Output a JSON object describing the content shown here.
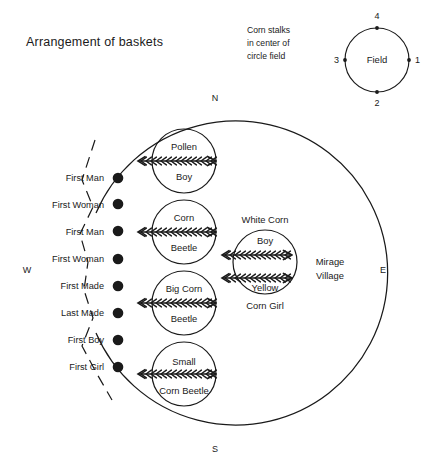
{
  "title": "Arrangement of baskets",
  "note": {
    "lines": [
      "Corn stalks",
      "in center of",
      "circle field"
    ]
  },
  "field_circle": {
    "label": "Field",
    "markers": [
      {
        "id": "1",
        "label": "1",
        "position": "east"
      },
      {
        "id": "2",
        "label": "2",
        "position": "south"
      },
      {
        "id": "3",
        "label": "3",
        "position": "west"
      },
      {
        "id": "4",
        "label": "4",
        "position": "north"
      }
    ]
  },
  "compass": {
    "north": "N",
    "south": "S",
    "east": "E",
    "west": "W"
  },
  "village_label": {
    "lines": [
      "Mirage",
      "Village"
    ]
  },
  "basket_rows": [
    {
      "label": "First Man"
    },
    {
      "label": "First Woman"
    },
    {
      "label": "First Man"
    },
    {
      "label": "First Woman"
    },
    {
      "label": "First Made"
    },
    {
      "label": "Last Made"
    },
    {
      "label": "First Boy"
    },
    {
      "label": "First Girl"
    }
  ],
  "inner_circles": [
    {
      "top": "Pollen",
      "bottom": "Boy"
    },
    {
      "top": "Corn",
      "bottom": "Beetle"
    },
    {
      "top": "Big Corn",
      "bottom": "Beetle"
    },
    {
      "top": "Small",
      "bottom": "Corn  Beetle"
    }
  ],
  "corn_circle": {
    "above": "White  Corn",
    "top": "Boy",
    "bottom": "Yellow",
    "below": "Corn  Girl"
  },
  "colors": {
    "ink": "#1a1a1a",
    "background": "#ffffff"
  }
}
